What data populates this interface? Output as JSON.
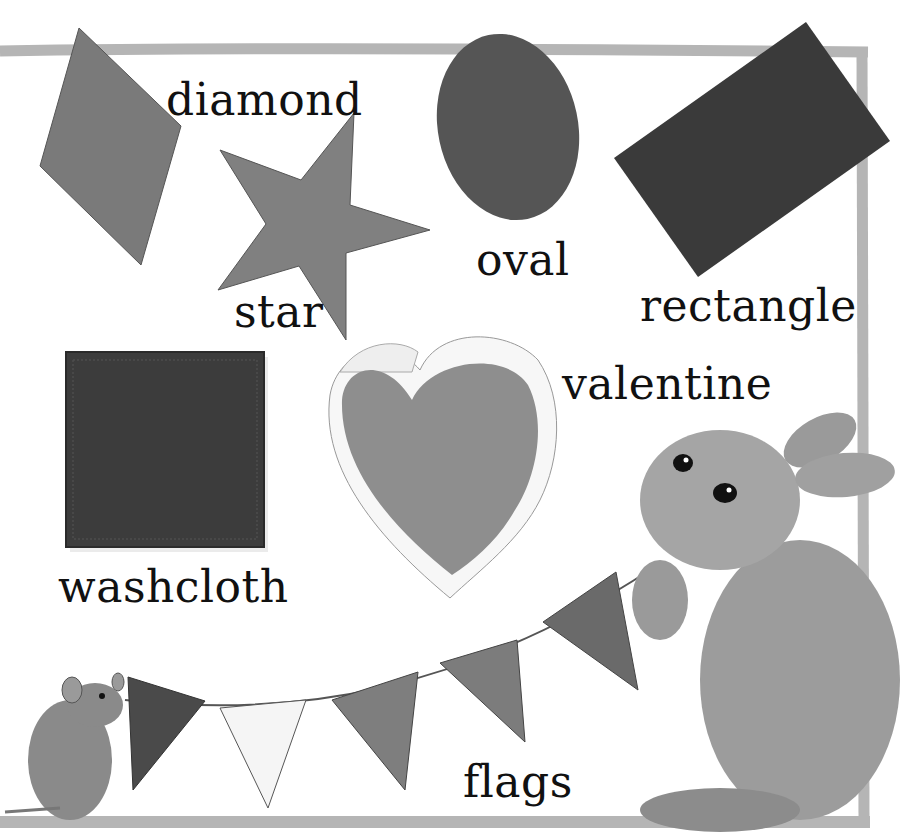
{
  "page": {
    "colors": {
      "background": "#ffffff",
      "frame": "#b5b5b5",
      "diamond": "#7a7a7a",
      "star": "#808080",
      "oval": "#555555",
      "rectangle": "#3a3a3a",
      "washcloth": "#3c3c3c",
      "valentine": "#8e8e8e",
      "flag_1": "#4a4a4a",
      "flag_2": "#f5f5f5",
      "flag_3": "#7e7e7e",
      "flag_4": "#7c7c7c",
      "flag_5": "#6a6a6a"
    }
  },
  "labels": {
    "diamond": "diamond",
    "star": "star",
    "oval": "oval",
    "rectangle": "rectangle",
    "washcloth": "washcloth",
    "valentine": "valentine",
    "flags": "flags"
  },
  "illustrations": {
    "bunny": "bunny holding flag string",
    "mouse": "mouse holding flag string"
  }
}
